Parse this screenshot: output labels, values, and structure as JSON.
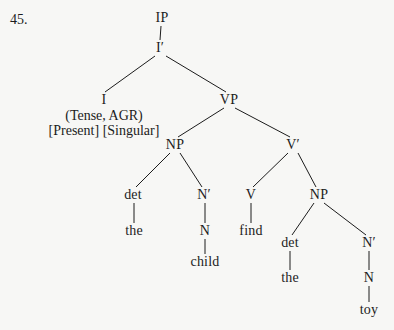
{
  "page": {
    "item_number": "45.",
    "background_color": "#f7f7f5",
    "ink_color": "#1c1c1c",
    "width": 394,
    "height": 330
  },
  "tree": {
    "type": "x-bar-syntax-tree",
    "sentence": "the child find the toy",
    "nodes": [
      {
        "id": "IP",
        "label": "IP",
        "x": 162,
        "y": 18
      },
      {
        "id": "Ibar",
        "label": "I′",
        "x": 160,
        "y": 48
      },
      {
        "id": "I",
        "label": "I",
        "x": 104,
        "y": 100
      },
      {
        "id": "VP",
        "label": "VP",
        "x": 229,
        "y": 100
      },
      {
        "id": "NP1",
        "label": "NP",
        "x": 175,
        "y": 145
      },
      {
        "id": "Vbar",
        "label": "V′",
        "x": 293,
        "y": 145
      },
      {
        "id": "det1",
        "label": "det",
        "x": 133,
        "y": 195
      },
      {
        "id": "Nbar1",
        "label": "N′",
        "x": 204,
        "y": 195
      },
      {
        "id": "V",
        "label": "V",
        "x": 251,
        "y": 195
      },
      {
        "id": "NP2",
        "label": "NP",
        "x": 319,
        "y": 195
      },
      {
        "id": "the1",
        "label": "the",
        "x": 134,
        "y": 231
      },
      {
        "id": "N1",
        "label": "N",
        "x": 205,
        "y": 231
      },
      {
        "id": "find",
        "label": "find",
        "x": 251,
        "y": 231
      },
      {
        "id": "det2",
        "label": "det",
        "x": 290,
        "y": 243
      },
      {
        "id": "Nbar2",
        "label": "N′",
        "x": 369,
        "y": 243
      },
      {
        "id": "child",
        "label": "child",
        "x": 205,
        "y": 262
      },
      {
        "id": "the2",
        "label": "the",
        "x": 290,
        "y": 278
      },
      {
        "id": "N2",
        "label": "N",
        "x": 369,
        "y": 278
      },
      {
        "id": "toy",
        "label": "toy",
        "x": 369,
        "y": 310
      }
    ],
    "edges": [
      {
        "from": "IP",
        "to": "Ibar",
        "x1": 161,
        "y1": 26,
        "x2": 160,
        "y2": 40
      },
      {
        "from": "Ibar",
        "to": "I",
        "x1": 155,
        "y1": 56,
        "x2": 105,
        "y2": 92
      },
      {
        "from": "Ibar",
        "to": "VP",
        "x1": 166,
        "y1": 56,
        "x2": 226,
        "y2": 92
      },
      {
        "from": "VP",
        "to": "NP1",
        "x1": 224,
        "y1": 108,
        "x2": 178,
        "y2": 137
      },
      {
        "from": "VP",
        "to": "Vbar",
        "x1": 235,
        "y1": 108,
        "x2": 290,
        "y2": 137
      },
      {
        "from": "NP1",
        "to": "det1",
        "x1": 170,
        "y1": 153,
        "x2": 136,
        "y2": 187
      },
      {
        "from": "NP1",
        "to": "Nbar1",
        "x1": 180,
        "y1": 153,
        "x2": 202,
        "y2": 187
      },
      {
        "from": "Vbar",
        "to": "V",
        "x1": 288,
        "y1": 153,
        "x2": 253,
        "y2": 187
      },
      {
        "from": "Vbar",
        "to": "NP2",
        "x1": 298,
        "y1": 153,
        "x2": 316,
        "y2": 187
      },
      {
        "from": "det1",
        "to": "the1",
        "x1": 134,
        "y1": 203,
        "x2": 134,
        "y2": 223
      },
      {
        "from": "Nbar1",
        "to": "N1",
        "x1": 205,
        "y1": 203,
        "x2": 205,
        "y2": 223
      },
      {
        "from": "V",
        "to": "find",
        "x1": 251,
        "y1": 203,
        "x2": 251,
        "y2": 223
      },
      {
        "from": "NP2",
        "to": "det2",
        "x1": 314,
        "y1": 203,
        "x2": 292,
        "y2": 235
      },
      {
        "from": "NP2",
        "to": "Nbar2",
        "x1": 324,
        "y1": 203,
        "x2": 366,
        "y2": 235
      },
      {
        "from": "N1",
        "to": "child",
        "x1": 205,
        "y1": 239,
        "x2": 205,
        "y2": 254
      },
      {
        "from": "det2",
        "to": "the2",
        "x1": 290,
        "y1": 251,
        "x2": 290,
        "y2": 270
      },
      {
        "from": "Nbar2",
        "to": "N2",
        "x1": 369,
        "y1": 251,
        "x2": 369,
        "y2": 270
      },
      {
        "from": "N2",
        "to": "toy",
        "x1": 369,
        "y1": 286,
        "x2": 369,
        "y2": 302
      }
    ],
    "annotations": [
      {
        "id": "infl-features",
        "text": "(Tense, AGR)",
        "x": 104,
        "y": 116
      },
      {
        "id": "infl-values",
        "text": "[Present] [Singular]",
        "x": 104,
        "y": 131
      }
    ]
  }
}
